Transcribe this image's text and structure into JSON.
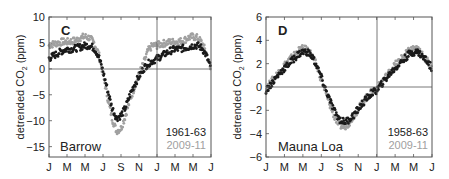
{
  "chart_data": [
    {
      "panel": "C",
      "type": "scatter",
      "title": "Barrow",
      "xlabel": "",
      "ylabel": "detrended CO2 (ppm)",
      "ylim": [
        -17,
        10
      ],
      "yticks": [
        10,
        5,
        0,
        -5,
        -10,
        -15
      ],
      "xtick_labels": [
        "J",
        "M",
        "M",
        "J",
        "S",
        "N",
        "J",
        "M",
        "M",
        "J"
      ],
      "x_months": 18,
      "grid": false,
      "zero_line": true,
      "year_divider_month": 12,
      "legend": [
        {
          "name": "1961-63",
          "color": "#1a1a1a"
        },
        {
          "name": "2009-11",
          "color": "#a0a0a0"
        }
      ],
      "legend_position": "lower right",
      "series": [
        {
          "name": "1961-63",
          "color": "#1a1a1a",
          "month": [
            0,
            0.5,
            1,
            1.5,
            2,
            2.5,
            3,
            3.5,
            4,
            4.5,
            5,
            5.5,
            6,
            6.5,
            7,
            7.5,
            8,
            8.5,
            9,
            9.5,
            10,
            10.5,
            11,
            11.5,
            12,
            12.5,
            13,
            13.5,
            14,
            14.5,
            15,
            15.5,
            16,
            16.5,
            17,
            17.5,
            18
          ],
          "values": [
            2.0,
            2.5,
            3.0,
            3.5,
            3.8,
            3.8,
            4.0,
            4.2,
            4.5,
            4.5,
            4.0,
            2.5,
            -0.5,
            -4.0,
            -7.5,
            -9.5,
            -9.0,
            -7.5,
            -5.0,
            -3.0,
            -1.5,
            0.0,
            1.0,
            1.5,
            2.0,
            2.5,
            3.0,
            3.5,
            3.8,
            3.8,
            4.0,
            4.2,
            4.5,
            4.5,
            4.0,
            2.5,
            0.0
          ]
        },
        {
          "name": "2009-11",
          "color": "#a0a0a0",
          "month": [
            0,
            0.5,
            1,
            1.5,
            2,
            2.5,
            3,
            3.5,
            4,
            4.5,
            5,
            5.5,
            6,
            6.5,
            7,
            7.5,
            8,
            8.5,
            9,
            9.5,
            10,
            10.5,
            11,
            11.5,
            12,
            12.5,
            13,
            13.5,
            14,
            14.5,
            15,
            15.5,
            16,
            16.5,
            17,
            17.5,
            18
          ],
          "values": [
            4.5,
            4.8,
            5.0,
            5.2,
            5.2,
            5.3,
            5.5,
            6.0,
            6.2,
            6.0,
            5.0,
            3.0,
            -1.0,
            -5.5,
            -9.5,
            -12.0,
            -11.5,
            -9.0,
            -6.0,
            -3.5,
            -1.0,
            1.0,
            3.5,
            4.5,
            4.5,
            4.8,
            5.0,
            5.2,
            5.2,
            5.3,
            5.5,
            6.0,
            6.2,
            6.0,
            5.0,
            3.0,
            -0.5
          ]
        }
      ]
    },
    {
      "panel": "D",
      "type": "scatter",
      "title": "Mauna Loa",
      "xlabel": "",
      "ylabel": "detrended CO2 (ppm)",
      "ylim": [
        -6,
        6
      ],
      "yticks": [
        6,
        4,
        2,
        0,
        -2,
        -4,
        -6
      ],
      "xtick_labels": [
        "J",
        "M",
        "M",
        "J",
        "S",
        "N",
        "J",
        "M",
        "M",
        "J"
      ],
      "x_months": 18,
      "grid": false,
      "zero_line": true,
      "year_divider_month": 12,
      "legend": [
        {
          "name": "1958-63",
          "color": "#1a1a1a"
        },
        {
          "name": "2009-11",
          "color": "#a0a0a0"
        }
      ],
      "legend_position": "lower right",
      "series": [
        {
          "name": "1958-63",
          "color": "#1a1a1a",
          "month": [
            0,
            0.5,
            1,
            1.5,
            2,
            2.5,
            3,
            3.5,
            4,
            4.5,
            5,
            5.5,
            6,
            6.5,
            7,
            7.5,
            8,
            8.5,
            9,
            9.5,
            10,
            10.5,
            11,
            11.5,
            12,
            12.5,
            13,
            13.5,
            14,
            14.5,
            15,
            15.5,
            16,
            16.5,
            17,
            17.5,
            18
          ],
          "values": [
            -0.3,
            0.2,
            0.7,
            1.2,
            1.6,
            2.0,
            2.4,
            2.8,
            3.0,
            3.0,
            2.6,
            1.8,
            0.8,
            -0.3,
            -1.3,
            -2.2,
            -2.8,
            -3.0,
            -2.8,
            -2.4,
            -1.9,
            -1.4,
            -0.9,
            -0.5,
            -0.3,
            0.2,
            0.7,
            1.2,
            1.6,
            2.0,
            2.4,
            2.8,
            3.0,
            3.0,
            2.6,
            2.2,
            1.6
          ]
        },
        {
          "name": "2009-11",
          "color": "#a0a0a0",
          "month": [
            0,
            0.5,
            1,
            1.5,
            2,
            2.5,
            3,
            3.5,
            4,
            4.5,
            5,
            5.5,
            6,
            6.5,
            7,
            7.5,
            8,
            8.5,
            9,
            9.5,
            10,
            10.5,
            11,
            11.5,
            12,
            12.5,
            13,
            13.5,
            14,
            14.5,
            15,
            15.5,
            16,
            16.5,
            17,
            17.5,
            18
          ],
          "values": [
            -0.2,
            0.4,
            0.9,
            1.4,
            1.9,
            2.3,
            2.7,
            3.1,
            3.3,
            3.2,
            2.7,
            1.8,
            0.6,
            -0.6,
            -1.7,
            -2.7,
            -3.3,
            -3.4,
            -3.1,
            -2.5,
            -1.9,
            -1.3,
            -0.8,
            -0.4,
            -0.2,
            0.4,
            0.9,
            1.4,
            1.9,
            2.3,
            2.7,
            3.1,
            3.3,
            3.2,
            2.7,
            2.2,
            1.6
          ]
        }
      ]
    }
  ],
  "panels": {
    "left": {
      "label": "C",
      "site": "Barrow",
      "ylabel_prefix": "detrended CO",
      "ylabel_sub": "2",
      "ylabel_suffix": " (ppm)",
      "legend_dark": "1961-63",
      "legend_light": "2009-11"
    },
    "right": {
      "label": "D",
      "site": "Mauna Loa",
      "ylabel_prefix": "detrended CO",
      "ylabel_sub": "2",
      "ylabel_suffix": " (ppm)",
      "legend_dark": "1958-63",
      "legend_light": "2009-11"
    }
  },
  "colors": {
    "dark_series": "#1a1a1a",
    "light_series": "#a0a0a0",
    "axis": "#555555",
    "text": "#222222"
  }
}
